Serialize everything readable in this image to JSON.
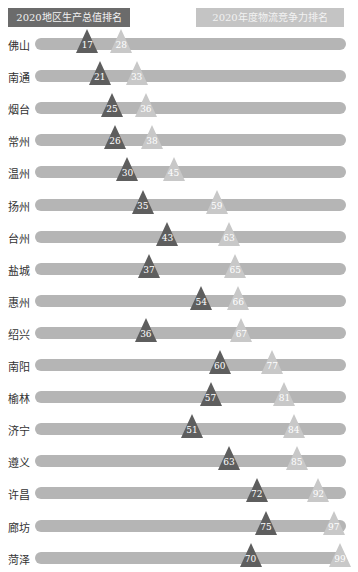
{
  "legend": {
    "gdp": "2020地区生产总值排名",
    "logistics": "2020年度物流竞争力排名"
  },
  "colors": {
    "gdp": "#5e5e5e",
    "logistics": "#c8c8c8",
    "track": "#b5b5b5"
  },
  "chart_data": {
    "type": "dot-range",
    "title": "",
    "categories": [
      "佛山",
      "南通",
      "烟台",
      "常州",
      "温州",
      "扬州",
      "台州",
      "盐城",
      "惠州",
      "绍兴",
      "南阳",
      "榆林",
      "济宁",
      "遵义",
      "许昌",
      "廊坊",
      "菏泽"
    ],
    "series": [
      {
        "name": "2020地区生产总值排名",
        "values": [
          17,
          21,
          25,
          26,
          30,
          35,
          43,
          37,
          54,
          36,
          60,
          57,
          51,
          63,
          72,
          75,
          70
        ]
      },
      {
        "name": "2020年度物流竞争力排名",
        "values": [
          28,
          33,
          36,
          38,
          45,
          59,
          63,
          65,
          66,
          67,
          77,
          81,
          84,
          85,
          92,
          97,
          99
        ]
      }
    ],
    "xlim": [
      0,
      100
    ],
    "legend_position": "top"
  }
}
